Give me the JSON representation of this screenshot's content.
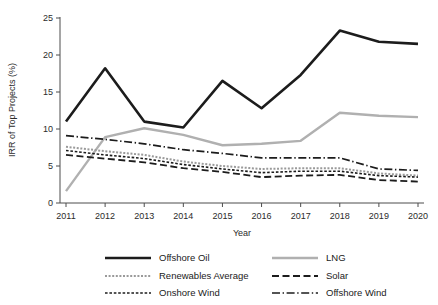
{
  "chart_data": {
    "type": "line",
    "title": "",
    "xlabel": "Year",
    "ylabel": "IRR of Top Projects (%)",
    "x": [
      2011,
      2012,
      2013,
      2014,
      2015,
      2016,
      2017,
      2018,
      2019,
      2020
    ],
    "xtick_labels": [
      "2011",
      "2012",
      "2013",
      "2014",
      "2015",
      "2016",
      "2017",
      "2018",
      "2019",
      "2020"
    ],
    "ytick_labels": [
      "0",
      "5",
      "10",
      "15",
      "20",
      "25"
    ],
    "yticks": [
      0,
      5,
      10,
      15,
      20,
      25
    ],
    "ylim": [
      0,
      25
    ],
    "xlim": [
      2011,
      2020
    ],
    "grid": false,
    "legend_position": "bottom",
    "legend_columns": 2,
    "series": [
      {
        "name": "Offshore Oil",
        "color": "#1c1c1c",
        "width": 2.6,
        "dash": "none",
        "values": [
          11.0,
          18.2,
          11.0,
          10.2,
          16.5,
          12.8,
          17.3,
          23.3,
          21.8,
          21.5
        ]
      },
      {
        "name": "LNG",
        "color": "#b0b0b0",
        "width": 2.4,
        "dash": "none",
        "values": [
          1.6,
          8.9,
          10.1,
          9.2,
          7.8,
          8.0,
          8.4,
          12.2,
          11.8,
          11.6
        ]
      },
      {
        "name": "Renewables Average",
        "color": "#9a9a9a",
        "width": 2.0,
        "dash": "2,1.6",
        "values": [
          7.6,
          7.0,
          6.5,
          5.6,
          5.0,
          4.6,
          4.7,
          4.7,
          4.0,
          3.7
        ]
      },
      {
        "name": "Solar",
        "color": "#1c1c1c",
        "width": 1.8,
        "dash": "7,3.5",
        "values": [
          6.5,
          6.0,
          5.5,
          4.7,
          4.2,
          3.5,
          3.7,
          3.8,
          3.1,
          2.9
        ]
      },
      {
        "name": "Onshore Wind",
        "color": "#1c1c1c",
        "width": 1.6,
        "dash": "2.6,1.8",
        "values": [
          7.1,
          6.5,
          6.0,
          5.2,
          4.6,
          4.1,
          4.3,
          4.3,
          3.7,
          3.5
        ]
      },
      {
        "name": "Offshore Wind",
        "color": "#1c1c1c",
        "width": 1.7,
        "dash": "8,2.6,1.4,2.6",
        "values": [
          9.1,
          8.6,
          8.0,
          7.2,
          6.7,
          6.1,
          6.1,
          6.1,
          4.6,
          4.4
        ]
      }
    ],
    "legend_order": [
      "Offshore Oil",
      "LNG",
      "Renewables Average",
      "Solar",
      "Onshore Wind",
      "Offshore Wind"
    ]
  },
  "layout": {
    "plot_left": 60,
    "plot_right": 424,
    "plot_top": 18,
    "plot_bottom": 203
  }
}
